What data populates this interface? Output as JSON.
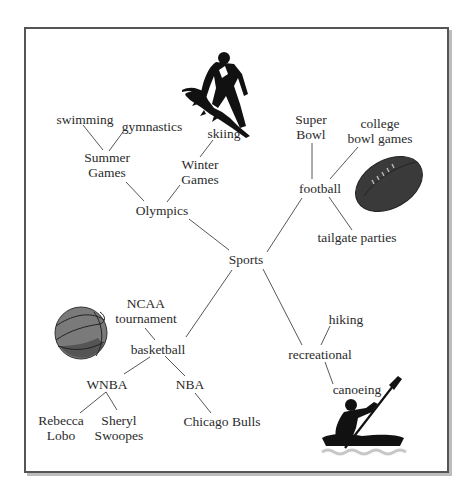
{
  "diagram": {
    "type": "concept-map",
    "root": "Sports",
    "nodes": {
      "sports": "Sports",
      "olympics": "Olympics",
      "summer_games": [
        "Summer",
        "Games"
      ],
      "winter_games": [
        "Winter",
        "Games"
      ],
      "swimming": "swimming",
      "gymnastics": "gymnastics",
      "skiing": "skiing",
      "football": "football",
      "super_bowl": [
        "Super",
        "Bowl"
      ],
      "college_bowl_games": [
        "college",
        "bowl games"
      ],
      "tailgate_parties": "tailgate parties",
      "basketball": "basketball",
      "ncaa_tournament": [
        "NCAA",
        "tournament"
      ],
      "wnba": "WNBA",
      "nba": "NBA",
      "rebecca_lobo": [
        "Rebecca",
        "Lobo"
      ],
      "sheryl_swoopes": [
        "Sheryl",
        "Swoopes"
      ],
      "chicago_bulls": "Chicago Bulls",
      "recreational": "recreational",
      "hiking": "hiking",
      "canoeing": "canoeing"
    },
    "edges": [
      [
        "Sports",
        "Olympics"
      ],
      [
        "Sports",
        "football"
      ],
      [
        "Sports",
        "basketball"
      ],
      [
        "Sports",
        "recreational"
      ],
      [
        "Olympics",
        "Summer Games"
      ],
      [
        "Olympics",
        "Winter Games"
      ],
      [
        "Summer Games",
        "swimming"
      ],
      [
        "Summer Games",
        "gymnastics"
      ],
      [
        "Winter Games",
        "skiing"
      ],
      [
        "football",
        "Super Bowl"
      ],
      [
        "football",
        "college bowl games"
      ],
      [
        "football",
        "tailgate parties"
      ],
      [
        "basketball",
        "NCAA tournament"
      ],
      [
        "basketball",
        "WNBA"
      ],
      [
        "basketball",
        "NBA"
      ],
      [
        "WNBA",
        "Rebecca Lobo"
      ],
      [
        "WNBA",
        "Sheryl Swoopes"
      ],
      [
        "NBA",
        "Chicago Bulls"
      ],
      [
        "recreational",
        "hiking"
      ],
      [
        "recreational",
        "canoeing"
      ]
    ],
    "icons": [
      "skier-icon",
      "football-icon",
      "basketball-icon",
      "kayaker-icon"
    ],
    "colors": {
      "frame": "#555555",
      "shadow": "#bdbdbd",
      "text": "#2b2b2b",
      "line": "#444444",
      "ball": "#3a3a3a"
    }
  }
}
